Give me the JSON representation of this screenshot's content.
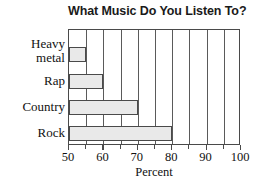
{
  "chart_data": {
    "type": "bar",
    "orientation": "horizontal",
    "title": "What Music Do You Listen To?",
    "xlabel": "Percent",
    "ylabel": "",
    "categories": [
      "Heavy metal",
      "Rap",
      "Country",
      "Rock"
    ],
    "values": [
      55,
      60,
      70,
      80
    ],
    "xlim": [
      50,
      100
    ],
    "xticks": [
      50,
      60,
      70,
      80,
      90,
      100
    ],
    "xtick_labels": [
      "50",
      "60",
      "70",
      "80",
      "90",
      "100"
    ],
    "minor_tick_step": 5,
    "grid": true,
    "grid_axis": "x",
    "legend": null,
    "bar_fill_color": "#e9e9e9",
    "bar_border_color": "#4a4a4a",
    "axis_color": "#4a4a4a",
    "title_color": "#1a1a1a",
    "bars": [
      {
        "category": "Heavy metal",
        "label": "Heavy\nmetal",
        "value": 55
      },
      {
        "category": "Rap",
        "label": "Rap",
        "value": 60
      },
      {
        "category": "Country",
        "label": "Country",
        "value": 70
      },
      {
        "category": "Rock",
        "label": "Rock",
        "value": 80
      }
    ]
  }
}
